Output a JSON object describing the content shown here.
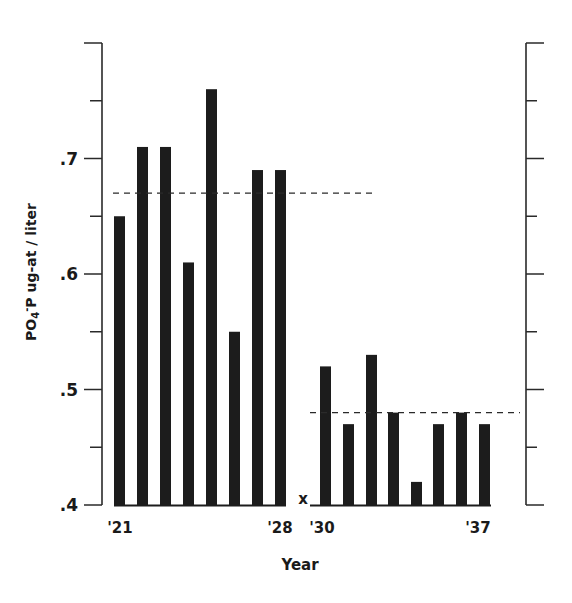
{
  "chart_data": {
    "type": "bar",
    "title": "",
    "xlabel": "Year",
    "ylabel": "PO4-P ug-at / liter",
    "ylabel_parts": {
      "main": "PO",
      "sub": "4",
      "sup": "-",
      "rest": "P ug-at / liter"
    },
    "ylim": [
      0.4,
      0.8
    ],
    "y_ticks": [
      ".4",
      ".5",
      ".6",
      ".7"
    ],
    "y_tick_values": [
      0.4,
      0.5,
      0.6,
      0.7
    ],
    "x_tick_labels": [
      {
        "label": "'21",
        "year": 1921
      },
      {
        "label": "'28",
        "year": 1928
      },
      {
        "label": "'30",
        "year": 1930
      },
      {
        "label": "'37",
        "year": 1937
      }
    ],
    "categories": [
      "1921",
      "1922",
      "1923",
      "1924",
      "1925",
      "1926",
      "1927",
      "1928",
      "1929",
      "1930",
      "1931",
      "1932",
      "1933",
      "1934",
      "1935",
      "1936",
      "1937"
    ],
    "values": [
      0.65,
      0.71,
      0.71,
      0.61,
      0.76,
      0.55,
      0.69,
      0.69,
      null,
      0.52,
      0.47,
      0.53,
      0.48,
      0.42,
      0.47,
      0.48,
      0.47
    ],
    "missing_marker": {
      "year": "1929",
      "symbol": "x"
    },
    "annotations": [
      {
        "type": "dashed-mean-line",
        "value": 0.67,
        "span": [
          "1921",
          "1931"
        ],
        "label": "mean 1921-1928"
      },
      {
        "type": "dashed-mean-line",
        "value": 0.48,
        "span": [
          "1930",
          "1937"
        ],
        "label": "mean 1930-1937"
      }
    ],
    "grid": false,
    "legend": null,
    "right_axis": true
  },
  "colors": {
    "bar": "#1c1c1c",
    "axis": "#2a2a2a",
    "background": "#ffffff"
  }
}
